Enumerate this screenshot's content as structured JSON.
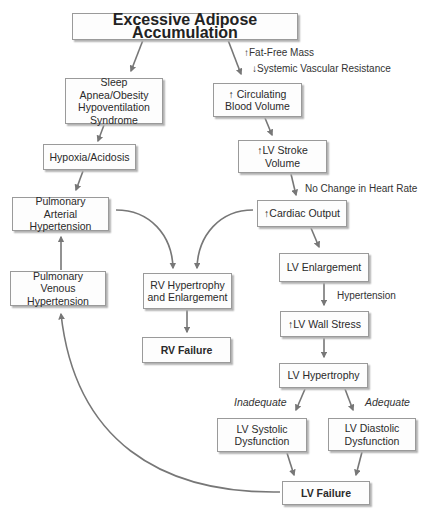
{
  "title": "Excessive Adipose Accumulation",
  "colors": {
    "arrow": "#777777",
    "border": "#9a9a9a",
    "shadow": "#b4b4b4"
  },
  "nodes": {
    "excessive_adipose": "Excessive Adipose Accumulation",
    "sleep_apnea": "Sleep Apnea/Obesity\nHypoventilation\nSyndrome",
    "hypoxia": "Hypoxia/Acidosis",
    "pulm_arterial": "Pulmonary\nArterial Hypertension",
    "pulm_venous": "Pulmonary\nVenous Hypertension",
    "rv_hypertrophy": "RV Hypertrophy\nand Enlargement",
    "rv_failure": "RV Failure",
    "circ_blood_volume": "↑ Circulating\nBlood Volume",
    "lv_stroke_volume": "↑LV Stroke\nVolume",
    "cardiac_output": "↑Cardiac Output",
    "lv_enlargement": "LV Enlargement",
    "lv_wall_stress": "↑LV Wall Stress",
    "lv_hypertrophy": "LV Hypertrophy",
    "lv_systolic": "LV Systolic\nDysfunction",
    "lv_diastolic": "LV Diastolic\nDysfunction",
    "lv_failure": "LV Failure"
  },
  "edge_labels": {
    "fat_free_mass": "↑Fat-Free Mass",
    "systemic_vascular_resistance": "↓Systemic Vascular Resistance",
    "no_change_hr": "No Change in Heart Rate",
    "hypertension": "Hypertension",
    "inadequate": "Inadequate",
    "adequate": "Adequate"
  }
}
